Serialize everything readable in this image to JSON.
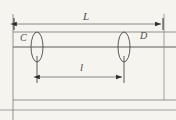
{
  "figure": {
    "kind": "engineering-dimension-diagram",
    "background_color": "#f6f4ef",
    "line_color": "#6b6b6b",
    "axis_color": "#3d3d3d",
    "text_color": "#4c4c4c",
    "width": 176,
    "height": 120,
    "labels": {
      "total_length": "L",
      "segment_length": "l",
      "left_section": "C",
      "right_section": "D"
    },
    "dimensions": [
      {
        "name": "overall-length",
        "symbol": "L",
        "y": 24,
        "x_start": 14,
        "x_end": 163,
        "arrow_start": true,
        "arrow_end": true
      },
      {
        "name": "inner-span",
        "symbol": "l",
        "y": 77,
        "x_start": 37,
        "x_end": 124,
        "arrow_start": true,
        "arrow_end": true
      }
    ],
    "sections": [
      {
        "name": "section-C",
        "symbol": "C",
        "cx": 37,
        "cy": 47,
        "rx": 6,
        "ry": 15
      },
      {
        "name": "section-D",
        "symbol": "D",
        "cx": 124,
        "cy": 47,
        "rx": 6,
        "ry": 15
      }
    ],
    "body_lines": {
      "top_edge_y": 32,
      "center_axis_y": 47,
      "lower_edge_y": 100,
      "bottom_edge_y": 110,
      "left_x": 13,
      "right_x": 164
    }
  }
}
